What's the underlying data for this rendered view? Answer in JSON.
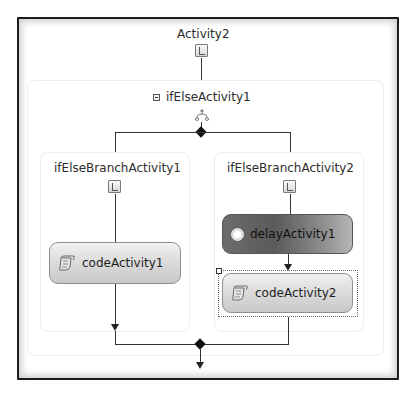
{
  "diagram": {
    "root": {
      "title": "Activity2",
      "icon": "sequential-workflow-icon"
    },
    "ifelse": {
      "title": "ifElseActivity1",
      "collapse_icon": "collapse-minus-icon",
      "icon": "ifelse-branch-icon"
    },
    "branches": [
      {
        "title": "ifElseBranchActivity1",
        "icon": "branch-condition-icon",
        "activities": [
          {
            "label": "codeActivity1",
            "icon": "code-icon",
            "style": "light"
          }
        ]
      },
      {
        "title": "ifElseBranchActivity2",
        "icon": "branch-condition-icon",
        "activities": [
          {
            "label": "delayActivity1",
            "icon": "stopwatch-icon",
            "style": "dark"
          },
          {
            "label": "codeActivity2",
            "icon": "code-icon",
            "style": "light",
            "selected": true
          }
        ]
      }
    ],
    "colors": {
      "frame_border": "#1c1c1c",
      "connector": "#333333",
      "activity_light": "#dcdcdc",
      "activity_dark": "#5a5a5a"
    }
  }
}
